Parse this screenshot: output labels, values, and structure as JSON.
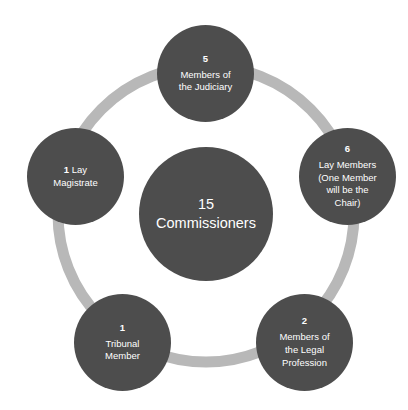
{
  "diagram": {
    "type": "radial-cycle",
    "colors": {
      "node_fill": "#4d4d4d",
      "ring": "#b8b8b8",
      "node_text": "#ffffff",
      "background": "#ffffff"
    },
    "hub": {
      "count": "15",
      "label": "Commissioners"
    },
    "nodes": [
      {
        "id": "judiciary",
        "count": "5",
        "label_line1": "Members of",
        "label_line2": "the Judiciary",
        "position": "top"
      },
      {
        "id": "lay-members",
        "count": "6",
        "label_line1": "Lay Members",
        "label_line2": "(One Member",
        "label_line3": "will be the",
        "label_line4": "Chair)",
        "position": "right"
      },
      {
        "id": "legal-profession",
        "count": "2",
        "label_line1": "Members of",
        "label_line2": "the Legal",
        "label_line3": "Profession",
        "position": "bottom-right"
      },
      {
        "id": "tribunal-member",
        "count": "1",
        "label_line1": "Tribunal",
        "label_line2": "Member",
        "position": "bottom-left"
      },
      {
        "id": "lay-magistrate",
        "count": "1",
        "label_line1": "Lay",
        "label_line2": "Magistrate",
        "position": "left",
        "count_inline": true
      }
    ]
  }
}
